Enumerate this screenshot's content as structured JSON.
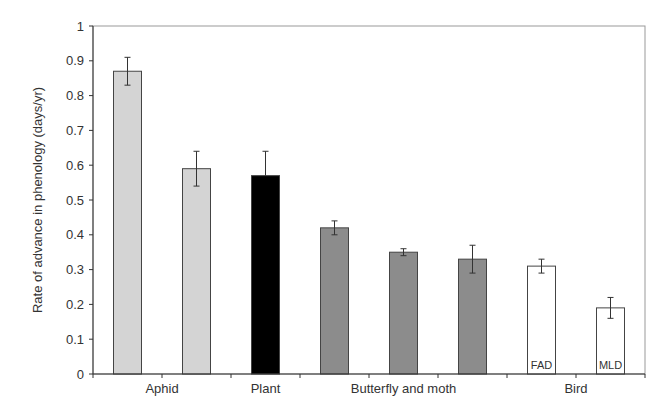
{
  "chart_data": {
    "type": "bar",
    "title": "",
    "xlabel": "",
    "ylabel": "Rate of advance in phenology (days/yr)",
    "ylim": [
      0,
      1
    ],
    "yticks": [
      "0",
      "0.1",
      "0.2",
      "0.3",
      "0.4",
      "0.5",
      "0.6",
      "0.7",
      "0.8",
      "0.9",
      "1"
    ],
    "grid": false,
    "legend": null,
    "groups": [
      {
        "label": "Aphid",
        "bar_indices": [
          0,
          1
        ]
      },
      {
        "label": "Plant",
        "bar_indices": [
          2
        ]
      },
      {
        "label": "Butterfly and moth",
        "bar_indices": [
          3,
          4,
          5
        ]
      },
      {
        "label": "Bird",
        "bar_indices": [
          6,
          7
        ]
      }
    ],
    "bars": [
      {
        "group": "Aphid",
        "label": "",
        "value": 0.87,
        "error": 0.04,
        "color": "#d4d4d4"
      },
      {
        "group": "Aphid",
        "label": "",
        "value": 0.59,
        "error": 0.05,
        "color": "#d4d4d4"
      },
      {
        "group": "Plant",
        "label": "",
        "value": 0.57,
        "error": 0.07,
        "error_upper_only": true,
        "color": "#000000"
      },
      {
        "group": "Butterfly and moth",
        "label": "",
        "value": 0.42,
        "error": 0.02,
        "color": "#8c8c8c"
      },
      {
        "group": "Butterfly and moth",
        "label": "",
        "value": 0.35,
        "error": 0.01,
        "color": "#8c8c8c"
      },
      {
        "group": "Butterfly and moth",
        "label": "",
        "value": 0.33,
        "error": 0.04,
        "color": "#8c8c8c"
      },
      {
        "group": "Bird",
        "label": "FAD",
        "value": 0.31,
        "error": 0.02,
        "color": "#ffffff"
      },
      {
        "group": "Bird",
        "label": "MLD",
        "value": 0.19,
        "error": 0.03,
        "color": "#ffffff"
      }
    ]
  }
}
